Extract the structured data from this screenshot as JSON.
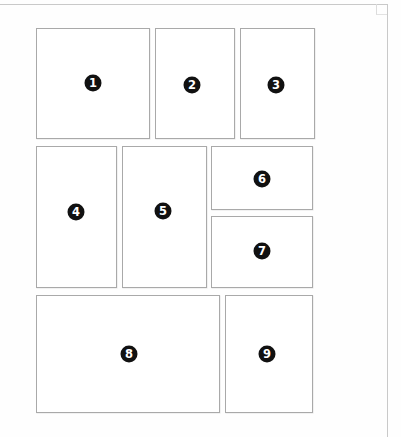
{
  "canvas": {
    "width": 401,
    "height": 437,
    "background_color": "#fefefe",
    "title": "Numbered Layout Blocks"
  },
  "frame": {
    "name": "page-frame",
    "border_color": "#c9c9c9",
    "has_top_line": true,
    "has_right_line": true,
    "has_corner_notch": true
  },
  "style": {
    "block_fill": "#ffffff",
    "block_border_color": "#a9a9a9",
    "badge_fill": "#111111",
    "badge_text_color": "#ffffff",
    "badge_diameter": 17
  },
  "blocks": [
    {
      "id": 1,
      "label": "1",
      "name": "block-1",
      "x": 36,
      "y": 28,
      "width": 114,
      "height": 111,
      "badge_x": 93,
      "badge_y": 83
    },
    {
      "id": 2,
      "label": "2",
      "name": "block-2",
      "x": 155,
      "y": 28,
      "width": 80,
      "height": 111,
      "badge_x": 192,
      "badge_y": 85
    },
    {
      "id": 3,
      "label": "3",
      "name": "block-3",
      "x": 240,
      "y": 28,
      "width": 75,
      "height": 111,
      "badge_x": 276,
      "badge_y": 85
    },
    {
      "id": 4,
      "label": "4",
      "name": "block-4",
      "x": 36,
      "y": 146,
      "width": 81,
      "height": 142,
      "badge_x": 76,
      "badge_y": 212
    },
    {
      "id": 5,
      "label": "5",
      "name": "block-5",
      "x": 122,
      "y": 146,
      "width": 85,
      "height": 142,
      "badge_x": 163,
      "badge_y": 211
    },
    {
      "id": 6,
      "label": "6",
      "name": "block-6",
      "x": 211,
      "y": 146,
      "width": 102,
      "height": 64,
      "badge_x": 262,
      "badge_y": 179
    },
    {
      "id": 7,
      "label": "7",
      "name": "block-7",
      "x": 211,
      "y": 216,
      "width": 102,
      "height": 72,
      "badge_x": 262,
      "badge_y": 251
    },
    {
      "id": 8,
      "label": "8",
      "name": "block-8",
      "x": 36,
      "y": 295,
      "width": 184,
      "height": 118,
      "badge_x": 129,
      "badge_y": 354
    },
    {
      "id": 9,
      "label": "9",
      "name": "block-9",
      "x": 225,
      "y": 295,
      "width": 88,
      "height": 118,
      "badge_x": 267,
      "badge_y": 354
    }
  ]
}
